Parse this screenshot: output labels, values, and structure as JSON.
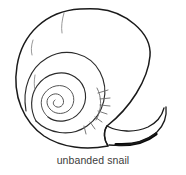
{
  "figure": {
    "subject": "unbanded snail",
    "caption": "unbanded snail",
    "illustration_style": "black-and-white line drawing",
    "background_color": "#ffffff",
    "outline_color": "#1a1a1a",
    "caption_color": "#3b3b3b",
    "detail_colors": {
      "whorl": "#2b2b2b",
      "spiral": "#555555",
      "growth_lines": "#8d8d8d",
      "hatching": "#6a6a6a",
      "aperture_shadow": "#0a0a0a"
    },
    "parts": {
      "body_whorl_label": "body whorl",
      "spire_label": "spire",
      "apex_label": "apex",
      "aperture_label": "aperture",
      "umbilicus_label": "umbilicus"
    }
  }
}
